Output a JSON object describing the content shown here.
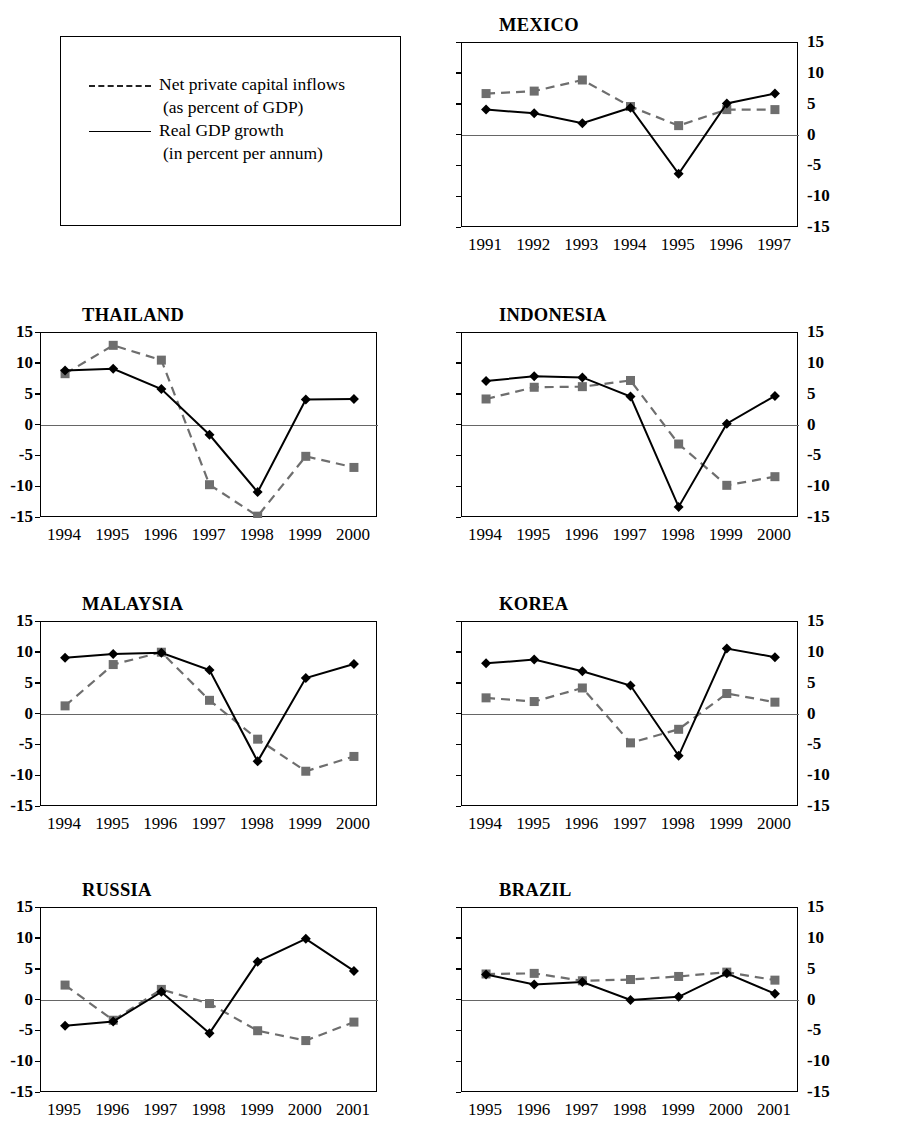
{
  "figure": {
    "background": "#ffffff",
    "series_colors": {
      "gdp": "#000000",
      "inflows": "#6e6e6e"
    }
  },
  "legend": {
    "entries": [
      {
        "style": "dashed",
        "line1": "Net private capital inflows",
        "line2": "(as percent of GDP)"
      },
      {
        "style": "solid",
        "line1": "Real GDP growth",
        "line2": "(in percent per annum)"
      }
    ]
  },
  "axis": {
    "yticks": [
      "15",
      "10",
      "5",
      "0",
      "-5",
      "-10",
      "-15"
    ],
    "ytick_values": [
      15,
      10,
      5,
      0,
      -5,
      -10,
      -15
    ],
    "ylim": [
      -15,
      15
    ]
  },
  "chart_data": [
    {
      "type": "line",
      "title": "MEXICO",
      "axis_side": "right",
      "xlabel": "",
      "ylabel": "",
      "ylim": [
        -15,
        15
      ],
      "grid": false,
      "legend_position": "external",
      "categories": [
        "1991",
        "1992",
        "1993",
        "1994",
        "1995",
        "1996",
        "1997"
      ],
      "series": [
        {
          "name": "Real GDP growth",
          "style": "solid",
          "marker": "diamond",
          "color": "#000000",
          "values": [
            4.2,
            3.6,
            2.0,
            4.5,
            -6.2,
            5.2,
            6.8
          ]
        },
        {
          "name": "Net private capital inflows",
          "style": "dashed",
          "marker": "square",
          "color": "#6e6e6e",
          "values": [
            6.8,
            7.2,
            9.0,
            4.7,
            1.6,
            4.2,
            4.2
          ]
        }
      ]
    },
    {
      "type": "line",
      "title": "THAILAND",
      "axis_side": "left",
      "xlabel": "",
      "ylabel": "",
      "ylim": [
        -15,
        15
      ],
      "grid": false,
      "legend_position": "external",
      "categories": [
        "1994",
        "1995",
        "1996",
        "1997",
        "1998",
        "1999",
        "2000"
      ],
      "series": [
        {
          "name": "Real GDP growth",
          "style": "solid",
          "marker": "diamond",
          "color": "#000000",
          "values": [
            8.9,
            9.2,
            5.9,
            -1.5,
            -10.8,
            4.2,
            4.3
          ]
        },
        {
          "name": "Net private capital inflows",
          "style": "dashed",
          "marker": "square",
          "color": "#6e6e6e",
          "values": [
            8.4,
            13.0,
            10.6,
            -9.6,
            -14.7,
            -5.0,
            -6.8
          ]
        }
      ]
    },
    {
      "type": "line",
      "title": "INDONESIA",
      "axis_side": "right",
      "xlabel": "",
      "ylabel": "",
      "ylim": [
        -15,
        15
      ],
      "grid": false,
      "legend_position": "external",
      "categories": [
        "1994",
        "1995",
        "1996",
        "1997",
        "1998",
        "1999",
        "2000"
      ],
      "series": [
        {
          "name": "Real GDP growth",
          "style": "solid",
          "marker": "diamond",
          "color": "#000000",
          "values": [
            7.2,
            8.0,
            7.8,
            4.7,
            -13.2,
            0.3,
            4.8
          ]
        },
        {
          "name": "Net private capital inflows",
          "style": "dashed",
          "marker": "square",
          "color": "#6e6e6e",
          "values": [
            4.3,
            6.2,
            6.3,
            7.3,
            -3.0,
            -9.7,
            -8.3
          ]
        }
      ]
    },
    {
      "type": "line",
      "title": "MALAYSIA",
      "axis_side": "left",
      "xlabel": "",
      "ylabel": "",
      "ylim": [
        -15,
        15
      ],
      "grid": false,
      "legend_position": "external",
      "categories": [
        "1994",
        "1995",
        "1996",
        "1997",
        "1998",
        "1999",
        "2000"
      ],
      "series": [
        {
          "name": "Real GDP growth",
          "style": "solid",
          "marker": "diamond",
          "color": "#000000",
          "values": [
            9.2,
            9.8,
            10.0,
            7.2,
            -7.6,
            5.9,
            8.2
          ]
        },
        {
          "name": "Net private capital inflows",
          "style": "dashed",
          "marker": "square",
          "color": "#6e6e6e",
          "values": [
            1.4,
            8.1,
            10.1,
            2.3,
            -4.0,
            -9.2,
            -6.8
          ]
        }
      ]
    },
    {
      "type": "line",
      "title": "KOREA",
      "axis_side": "right",
      "xlabel": "",
      "ylabel": "",
      "ylim": [
        -15,
        15
      ],
      "grid": false,
      "legend_position": "external",
      "categories": [
        "1994",
        "1995",
        "1996",
        "1997",
        "1998",
        "1999",
        "2000"
      ],
      "series": [
        {
          "name": "Real GDP growth",
          "style": "solid",
          "marker": "diamond",
          "color": "#000000",
          "values": [
            8.3,
            8.9,
            7.0,
            4.7,
            -6.7,
            10.7,
            9.3
          ]
        },
        {
          "name": "Net private capital inflows",
          "style": "dashed",
          "marker": "square",
          "color": "#6e6e6e",
          "values": [
            2.7,
            2.1,
            4.3,
            -4.6,
            -2.4,
            3.4,
            2.0
          ]
        }
      ]
    },
    {
      "type": "line",
      "title": "RUSSIA",
      "axis_side": "left",
      "xlabel": "",
      "ylabel": "",
      "ylim": [
        -15,
        15
      ],
      "grid": false,
      "legend_position": "external",
      "categories": [
        "1995",
        "1996",
        "1997",
        "1998",
        "1999",
        "2000",
        "2001"
      ],
      "series": [
        {
          "name": "Real GDP growth",
          "style": "solid",
          "marker": "diamond",
          "color": "#000000",
          "values": [
            -4.1,
            -3.4,
            1.4,
            -5.3,
            6.3,
            10.0,
            4.8
          ]
        },
        {
          "name": "Net private capital inflows",
          "style": "dashed",
          "marker": "square",
          "color": "#6e6e6e",
          "values": [
            2.5,
            -3.2,
            1.8,
            -0.5,
            -4.9,
            -6.5,
            -3.5
          ]
        }
      ]
    },
    {
      "type": "line",
      "title": "BRAZIL",
      "axis_side": "right",
      "xlabel": "",
      "ylabel": "",
      "ylim": [
        -15,
        15
      ],
      "grid": false,
      "legend_position": "external",
      "categories": [
        "1995",
        "1996",
        "1997",
        "1998",
        "1999",
        "2000",
        "2001"
      ],
      "series": [
        {
          "name": "Real GDP growth",
          "style": "solid",
          "marker": "diamond",
          "color": "#000000",
          "values": [
            4.2,
            2.6,
            3.0,
            0.1,
            0.6,
            4.4,
            1.1
          ]
        },
        {
          "name": "Net private capital inflows",
          "style": "dashed",
          "marker": "square",
          "color": "#6e6e6e",
          "values": [
            4.3,
            4.4,
            3.2,
            3.4,
            3.9,
            4.6,
            3.3
          ]
        }
      ]
    }
  ]
}
